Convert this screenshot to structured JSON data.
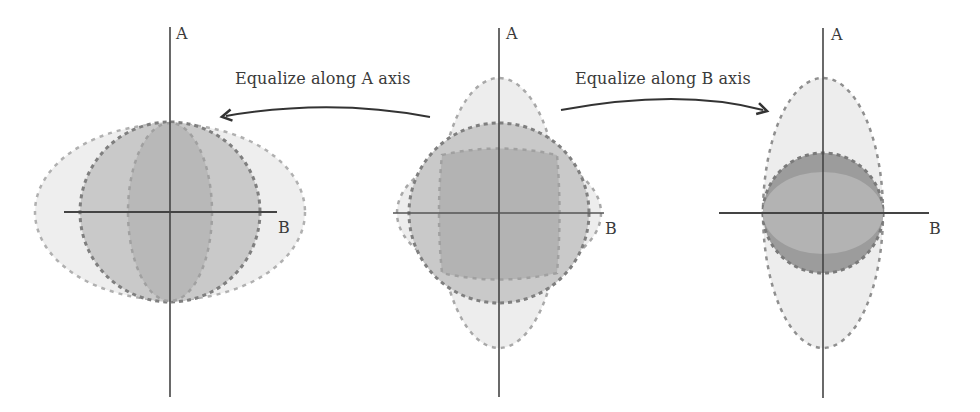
{
  "diagram": {
    "arrows": {
      "left": {
        "label": "Equalize along A axis",
        "direction": "from-center-to-left"
      },
      "right": {
        "label": "Equalize along B axis",
        "direction": "from-center-to-right"
      }
    },
    "panels": [
      {
        "id": "left",
        "axis_labels": {
          "vertical": "A",
          "horizontal": "B"
        },
        "shapes": [
          "wide-light-ellipse",
          "medium-circle",
          "narrow-inner-ellipse"
        ]
      },
      {
        "id": "center",
        "axis_labels": {
          "vertical": "A",
          "horizontal": "B"
        },
        "shapes": [
          "tall-light-ellipse",
          "wide-light-ellipse",
          "medium-circle",
          "inner-dark-region"
        ]
      },
      {
        "id": "right",
        "axis_labels": {
          "vertical": "A",
          "horizontal": "B"
        },
        "shapes": [
          "tall-light-ellipse",
          "dark-circle",
          "wide-inner-ellipse"
        ]
      }
    ],
    "colors": {
      "light_fill": "#eeeeee",
      "medium_fill": "#c9c9c9",
      "dark_fill": "#b3b3b3",
      "darker_fill": "#9c9c9c",
      "dash_dark": "#7f7f7f",
      "dash_light": "#a8a8a8",
      "axis": "#444444"
    }
  }
}
